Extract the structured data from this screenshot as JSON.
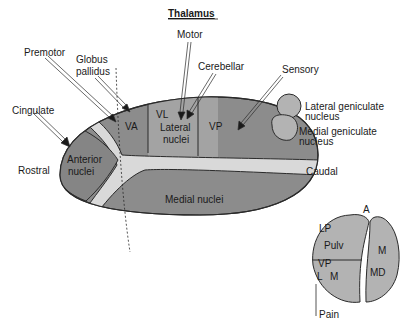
{
  "title": "Thalamus",
  "orientation": {
    "rostral": "Rostral",
    "caudal": "Caudal"
  },
  "inputs": {
    "premotor": "Premotor",
    "globus_pallidus_line1": "Globus",
    "globus_pallidus_line2": "pallidus",
    "motor": "Motor",
    "cerebellar": "Cerebellar",
    "sensory": "Sensory",
    "cingulate": "Cingulate"
  },
  "nuclei": {
    "va": "VA",
    "vl": "VL",
    "lateral_line1": "Lateral",
    "lateral_line2": "nuclei",
    "vp": "VP",
    "anterior_line1": "Anterior",
    "anterior_line2": "nuclei",
    "medial": "Medial nuclei"
  },
  "geniculate": {
    "lateral_line1": "Lateral geniculate",
    "lateral_line2": "nucleus",
    "medial_line1": "Medial geniculate",
    "medial_line2": "nucleus"
  },
  "cross_section": {
    "a": "A",
    "lp": "LP",
    "pulv": "Pulv",
    "vp": "VP",
    "l": "L",
    "m_left": "M",
    "m_right": "M",
    "md": "MD",
    "pain": "Pain"
  },
  "colors": {
    "dark_nuclei": "#8c8c8c",
    "lateral_nuclei": "#a3a3a3",
    "light_band": "#d9d9d9",
    "geniculate": "#b3b3b3",
    "outline": "#2a2a2a"
  }
}
